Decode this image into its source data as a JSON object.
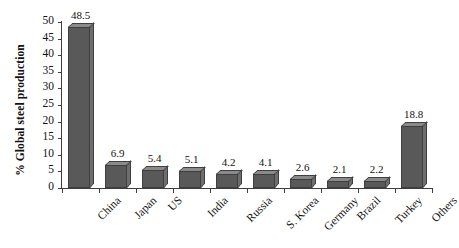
{
  "chart_data": {
    "type": "bar",
    "title": "",
    "xlabel": "",
    "ylabel": "% Global steel production",
    "ylim": [
      0,
      50
    ],
    "yticks": [
      0,
      5,
      10,
      15,
      20,
      25,
      30,
      35,
      40,
      45,
      50
    ],
    "grid": false,
    "legend": null,
    "categories": [
      "China",
      "Japan",
      "US",
      "India",
      "Russia",
      "S. Korea",
      "Germany",
      "Brazil",
      "Turkey",
      "Others"
    ],
    "values": [
      48.5,
      6.9,
      5.4,
      5.1,
      4.2,
      4.1,
      2.6,
      2.1,
      2.2,
      18.8
    ],
    "value_labels": [
      "48.5",
      "6.9",
      "5.4",
      "5.1",
      "4.2",
      "4.1",
      "2.6",
      "2.1",
      "2.2",
      "18.8"
    ],
    "tick_labels": [
      "50",
      "45",
      "40",
      "35",
      "30",
      "25",
      "20",
      "15",
      "10",
      "5",
      "0"
    ],
    "bar_color": "#595959",
    "bar_top_color": "#8a8a8a",
    "bar_side_color": "#6e6e6e",
    "bar_edge_color": "#3f3f3f",
    "axis_color": "#3d3d3d",
    "background_color": "#ffffff",
    "text_color": "#111111"
  }
}
